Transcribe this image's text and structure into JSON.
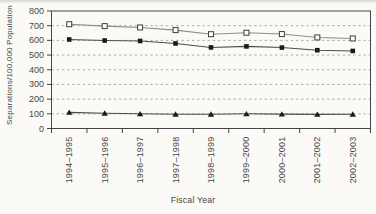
{
  "figure": {
    "background": "#fbfaf7",
    "ink_color": "#454545",
    "text_color": "#474747",
    "grid_color": "#a5a19a"
  },
  "chart_data": {
    "type": "line",
    "title": "",
    "xlabel": "Fiscal Year",
    "ylabel": "Separations/100,000 Population",
    "categories": [
      "1994–1995",
      "1995–1996",
      "1996–1997",
      "1997–1998",
      "1998–1999",
      "1999–2000",
      "2000–2001",
      "2001–2002",
      "2002–2003"
    ],
    "ylim": [
      0,
      800
    ],
    "yticks": [
      0,
      100,
      200,
      300,
      400,
      500,
      600,
      700,
      800
    ],
    "grid": "horizontal-dashed",
    "legend_position": "none",
    "series": [
      {
        "name": "open-square-series",
        "marker": "open-square",
        "line_color": "#8c8c8c",
        "marker_fill": "#ffffff",
        "marker_stroke": "#3d3d3d",
        "values": [
          710,
          697,
          688,
          670,
          642,
          652,
          643,
          620,
          613
        ]
      },
      {
        "name": "filled-square-series",
        "marker": "filled-square",
        "line_color": "#4c4c4c",
        "marker_fill": "#1a1a1a",
        "marker_stroke": "#1a1a1a",
        "values": [
          606,
          599,
          596,
          579,
          552,
          559,
          551,
          533,
          528
        ]
      },
      {
        "name": "filled-triangle-series",
        "marker": "filled-triangle",
        "line_color": "#4c4c4c",
        "marker_fill": "#1a1a1a",
        "marker_stroke": "#1a1a1a",
        "values": [
          110,
          104,
          100,
          97,
          97,
          100,
          98,
          96,
          97
        ]
      }
    ]
  }
}
